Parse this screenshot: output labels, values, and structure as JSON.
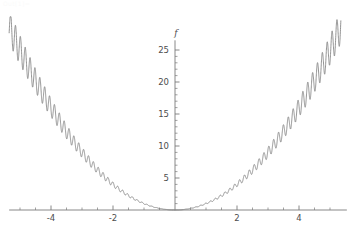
{
  "notebook": {
    "out_marker": "Out[1]="
  },
  "chart_data": {
    "type": "line",
    "title": "",
    "subtitle": "",
    "xlabel": "x",
    "ylabel": "f",
    "grid": false,
    "legend": null,
    "legend_position": "none",
    "xlim": [
      -5.35,
      5.35
    ],
    "ylim": [
      0,
      26.2
    ],
    "x_ticks_major": [
      -4,
      -2,
      2,
      4
    ],
    "x_tick_labels": [
      "-4",
      "-2",
      "2",
      "4"
    ],
    "x_tick_minor_step": 0.5,
    "y_ticks_major": [
      5,
      10,
      15,
      20,
      25
    ],
    "y_tick_labels": [
      "5",
      "10",
      "15",
      "20",
      "25"
    ],
    "y_tick_minor_step": 1,
    "axes_style": "centered-cross",
    "line_color": "#808080",
    "axis_color": "#7a7a7a",
    "background_color": "#ffffff",
    "series": [
      {
        "name": "f(x)",
        "description": "parabolic envelope x^2 with superposed rapid oscillation of amplitude growing with |x|",
        "envelope": "x^2",
        "oscillation_frequency": 40,
        "oscillation_amplitude_coefficient": 0.09,
        "samples_x": [
          -5.3,
          -5.0,
          -4.5,
          -4.0,
          -3.5,
          -3.0,
          -2.5,
          -2.0,
          -1.5,
          -1.0,
          -0.5,
          0.0,
          0.5,
          1.0,
          1.5,
          2.0,
          2.5,
          3.0,
          3.5,
          4.0,
          4.5,
          5.0,
          5.3
        ],
        "samples_y": [
          28.1,
          25.0,
          20.3,
          16.0,
          12.3,
          9.0,
          6.3,
          4.0,
          2.3,
          1.0,
          0.3,
          0.0,
          0.3,
          1.0,
          2.3,
          4.0,
          6.3,
          9.0,
          12.3,
          16.0,
          20.3,
          25.0,
          28.1
        ]
      }
    ]
  }
}
